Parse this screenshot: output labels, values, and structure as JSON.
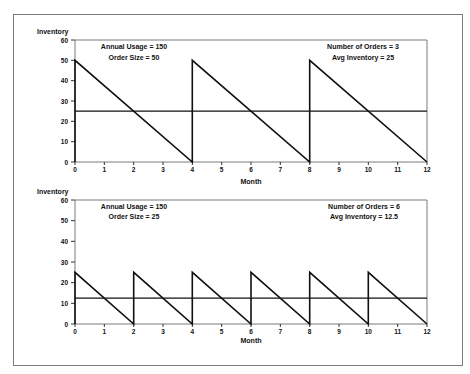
{
  "chart_data": [
    {
      "type": "line",
      "title": "",
      "xlabel": "Month",
      "ylabel": "Inventory",
      "xlim": [
        0,
        12
      ],
      "ylim": [
        0,
        60
      ],
      "xticks": [
        0,
        1,
        2,
        3,
        4,
        5,
        6,
        7,
        8,
        9,
        10,
        11,
        12
      ],
      "yticks": [
        0,
        10,
        20,
        30,
        40,
        50,
        60
      ],
      "grid": false,
      "annotations_left": [
        "Annual Usage = 150",
        "Order Size = 50"
      ],
      "annotations_right": [
        "Number of Orders = 3",
        "Avg Inventory = 25"
      ],
      "series": [
        {
          "name": "Inventory level",
          "x": [
            0,
            0,
            4,
            4,
            8,
            8,
            12
          ],
          "y": [
            0,
            50,
            0,
            50,
            0,
            50,
            0
          ]
        },
        {
          "name": "Average inventory",
          "x": [
            0,
            12
          ],
          "y": [
            25,
            25
          ]
        }
      ]
    },
    {
      "type": "line",
      "title": "",
      "xlabel": "Month",
      "ylabel": "Inventory",
      "xlim": [
        0,
        12
      ],
      "ylim": [
        0,
        60
      ],
      "xticks": [
        0,
        1,
        2,
        3,
        4,
        5,
        6,
        7,
        8,
        9,
        10,
        11,
        12
      ],
      "yticks": [
        0,
        10,
        20,
        30,
        40,
        50,
        60
      ],
      "grid": false,
      "annotations_left": [
        "Annual Usage = 150",
        "Order Size = 25"
      ],
      "annotations_right": [
        "Number of Orders = 6",
        "Avg Inventory = 12.5"
      ],
      "series": [
        {
          "name": "Inventory level",
          "x": [
            0,
            0,
            2,
            2,
            4,
            4,
            6,
            6,
            8,
            8,
            10,
            10,
            12
          ],
          "y": [
            0,
            25,
            0,
            25,
            0,
            25,
            0,
            25,
            0,
            25,
            0,
            25,
            0
          ]
        },
        {
          "name": "Average inventory",
          "x": [
            0,
            12
          ],
          "y": [
            12.5,
            12.5
          ]
        }
      ]
    }
  ],
  "top": {
    "ylabel": "Inventory",
    "xlabel": "Month",
    "ann_left_1": "Annual Usage = 150",
    "ann_left_2": "Order Size = 50",
    "ann_right_1": "Number of Orders = 3",
    "ann_right_2": "Avg Inventory = 25"
  },
  "bottom": {
    "ylabel": "Inventory",
    "xlabel": "Month",
    "ann_left_1": "Annual Usage = 150",
    "ann_left_2": "Order Size = 25",
    "ann_right_1": "Number of Orders = 6",
    "ann_right_2": "Avg Inventory = 12.5"
  },
  "colors": {
    "line": "#111111",
    "frame": "#7a7a7a"
  }
}
